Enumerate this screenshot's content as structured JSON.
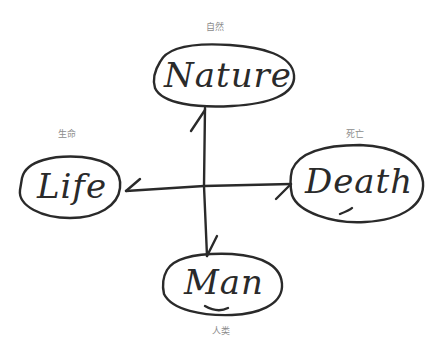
{
  "diagram": {
    "nodes": [
      {
        "id": "nature",
        "word": "Nature",
        "label": "自然"
      },
      {
        "id": "life",
        "word": "Life",
        "label": "生命"
      },
      {
        "id": "death",
        "word": "Death",
        "label": "死亡"
      },
      {
        "id": "man",
        "word": "Man",
        "label": "人类"
      }
    ],
    "edges": [
      {
        "from": "center",
        "to": "nature"
      },
      {
        "from": "center",
        "to": "life"
      },
      {
        "from": "center",
        "to": "death"
      },
      {
        "from": "center",
        "to": "man"
      }
    ],
    "colors": {
      "ink": "#2a2a2a",
      "label": "#8c8c8c",
      "background": "#ffffff"
    }
  }
}
